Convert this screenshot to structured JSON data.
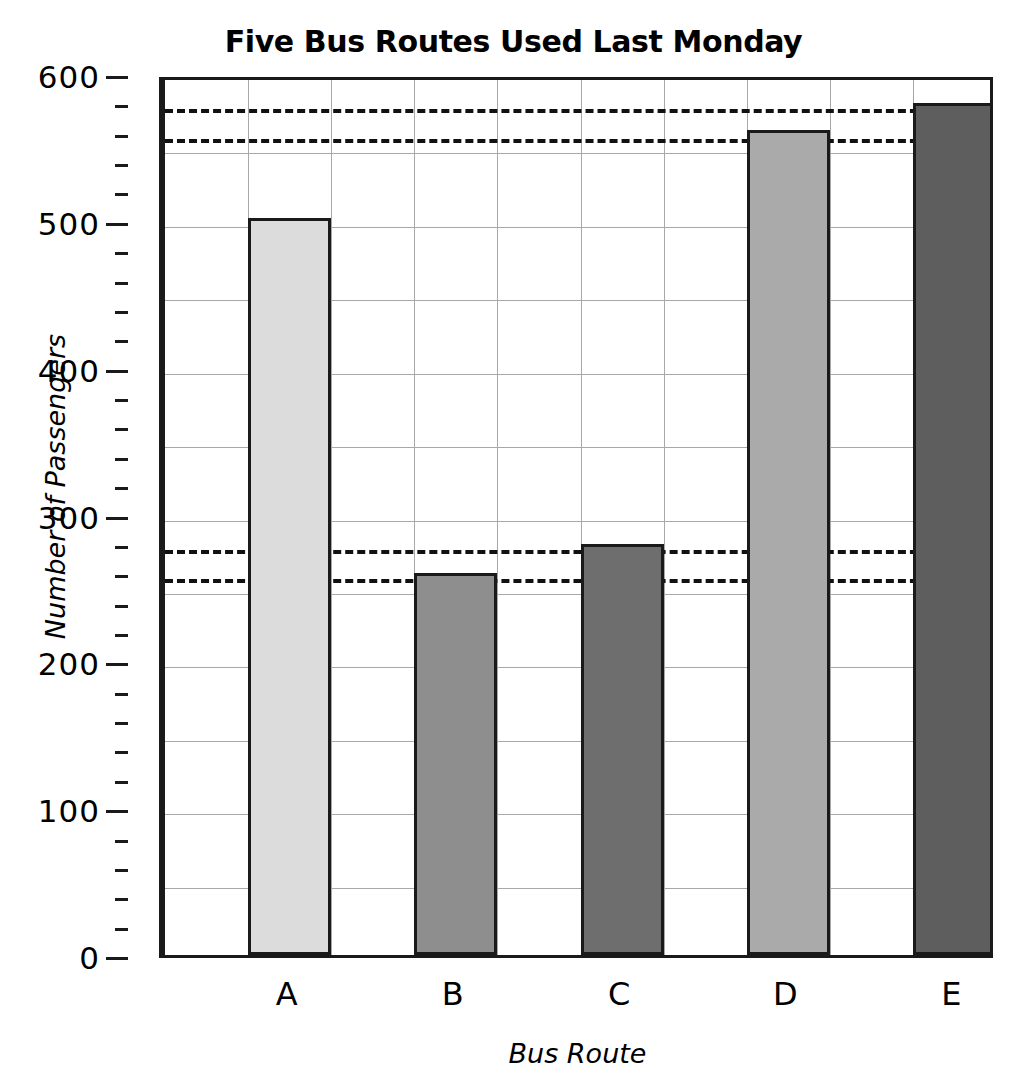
{
  "chart_data": {
    "type": "bar",
    "title": "Five Bus Routes Used Last Monday",
    "xlabel": "Bus Route",
    "ylabel": "Number of Passengers",
    "categories": [
      "A",
      "B",
      "C",
      "D",
      "E"
    ],
    "values": [
      502,
      260,
      280,
      562,
      580
    ],
    "bar_colors": [
      "#dcdcdc",
      "#8e8e8e",
      "#6e6e6e",
      "#aaaaaa",
      "#5e5e5e"
    ],
    "bar_edge_color": "#1a1a1a",
    "ylim": [
      0,
      600
    ],
    "xlim_categories": 5,
    "ytick_labels": [
      "0",
      "100",
      "200",
      "300",
      "400",
      "500",
      "600"
    ],
    "ytick_values": [
      0,
      100,
      200,
      300,
      400,
      500,
      600
    ],
    "yminor_tick_step": 20,
    "gridlines_y": [
      50,
      100,
      150,
      200,
      250,
      300,
      350,
      400,
      450,
      500,
      550
    ],
    "grid": true,
    "legend": "none",
    "annotations": [
      {
        "type": "reference-line",
        "style": "dashed",
        "value": 580,
        "label": "580"
      },
      {
        "type": "reference-line",
        "style": "dashed",
        "value": 560,
        "label": "560"
      },
      {
        "type": "reference-line",
        "style": "dashed",
        "value": 280,
        "label": "280"
      },
      {
        "type": "reference-line",
        "style": "dashed",
        "value": 260,
        "label": "260"
      }
    ],
    "reference_line_values": [
      580,
      560,
      280,
      260
    ]
  },
  "axis": {
    "y_label": "Number of Passengers",
    "x_label": "Bus Route",
    "y_ticks": [
      {
        "label": "600",
        "value": 600
      },
      {
        "label": "500",
        "value": 500
      },
      {
        "label": "400",
        "value": 400
      },
      {
        "label": "300",
        "value": 300
      },
      {
        "label": "200",
        "value": 200
      },
      {
        "label": "100",
        "value": 100
      },
      {
        "label": "0",
        "value": 0
      }
    ],
    "x_ticks": [
      {
        "label": "A"
      },
      {
        "label": "B"
      },
      {
        "label": "C"
      },
      {
        "label": "D"
      },
      {
        "label": "E"
      }
    ]
  },
  "title": "Five Bus Routes Used Last Monday"
}
